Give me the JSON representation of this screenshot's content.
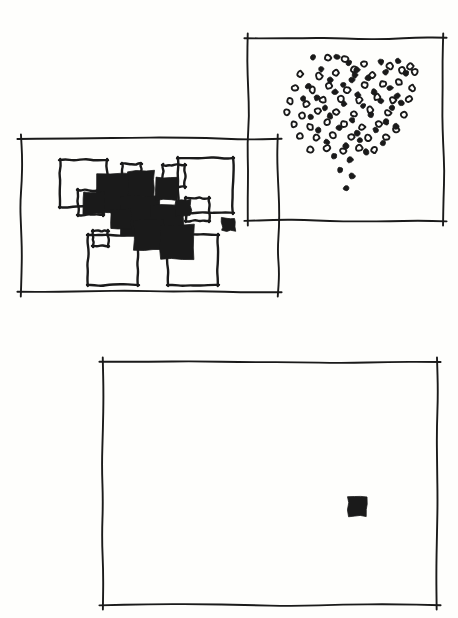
{
  "figure": {
    "title": "",
    "style": "hand-drawn ink sketch",
    "ink_color": "#1a1a1a",
    "paper_color": "#fefefc",
    "width": 458,
    "height": 618
  },
  "chart_data": {
    "type": "scatter",
    "title": "",
    "xlabel": "",
    "ylabel": "",
    "grid": false,
    "legend": "none",
    "panels": [
      {
        "id": "panel-squares",
        "name": "left-panel-overlapping-squares",
        "frame": {
          "x": 21,
          "y": 139,
          "width": 257,
          "height": 153
        },
        "marker_type": "square",
        "note": "cluster of overlapping filled and outlined squares plus one isolated small filled square",
        "filled_squares": [
          {
            "x": 97,
            "y": 174,
            "size": 38
          },
          {
            "x": 128,
            "y": 171,
            "size": 26
          },
          {
            "x": 120,
            "y": 196,
            "size": 40
          },
          {
            "x": 156,
            "y": 178,
            "size": 22
          },
          {
            "x": 150,
            "y": 205,
            "size": 34
          },
          {
            "x": 83,
            "y": 192,
            "size": 22
          },
          {
            "x": 134,
            "y": 220,
            "size": 30
          },
          {
            "x": 160,
            "y": 225,
            "size": 34
          },
          {
            "x": 111,
            "y": 209,
            "size": 20
          },
          {
            "x": 175,
            "y": 200,
            "size": 16
          },
          {
            "x": 222,
            "y": 218,
            "size": 13
          }
        ],
        "outlined_squares": [
          {
            "x": 60,
            "y": 160,
            "size": 47
          },
          {
            "x": 78,
            "y": 190,
            "size": 25
          },
          {
            "x": 122,
            "y": 164,
            "size": 19
          },
          {
            "x": 163,
            "y": 165,
            "size": 22
          },
          {
            "x": 178,
            "y": 158,
            "size": 55
          },
          {
            "x": 186,
            "y": 198,
            "size": 23
          },
          {
            "x": 93,
            "y": 231,
            "size": 15
          },
          {
            "x": 88,
            "y": 235,
            "size": 50
          },
          {
            "x": 168,
            "y": 235,
            "size": 50
          }
        ],
        "isolated_square": {
          "x": 222,
          "y": 218,
          "size": 13
        }
      },
      {
        "id": "panel-dots",
        "name": "top-right-panel-dot-cluster",
        "frame": {
          "x": 248,
          "y": 38,
          "width": 195,
          "height": 183
        },
        "marker_type": "circle",
        "note": "dense cluster of filled and open circles, denser at top, thinning into a tail at lower centre",
        "n_filled": 48,
        "n_open": 54,
        "filled_points": [
          [
            313,
            57
          ],
          [
            337,
            57
          ],
          [
            321,
            69
          ],
          [
            349,
            63
          ],
          [
            357,
            70
          ],
          [
            355,
            75
          ],
          [
            381,
            62
          ],
          [
            398,
            61
          ],
          [
            330,
            80
          ],
          [
            343,
            85
          ],
          [
            352,
            80
          ],
          [
            308,
            86
          ],
          [
            368,
            78
          ],
          [
            386,
            72
          ],
          [
            406,
            73
          ],
          [
            317,
            98
          ],
          [
            335,
            92
          ],
          [
            303,
            99
          ],
          [
            358,
            95
          ],
          [
            374,
            92
          ],
          [
            390,
            88
          ],
          [
            397,
            96
          ],
          [
            325,
            108
          ],
          [
            344,
            104
          ],
          [
            363,
            106
          ],
          [
            381,
            101
          ],
          [
            392,
            108
          ],
          [
            401,
            103
          ],
          [
            311,
            117
          ],
          [
            330,
            116
          ],
          [
            352,
            120
          ],
          [
            371,
            115
          ],
          [
            386,
            122
          ],
          [
            318,
            130
          ],
          [
            339,
            128
          ],
          [
            357,
            133
          ],
          [
            376,
            130
          ],
          [
            396,
            126
          ],
          [
            327,
            142
          ],
          [
            346,
            146
          ],
          [
            360,
            140
          ],
          [
            383,
            143
          ],
          [
            334,
            156
          ],
          [
            350,
            160
          ],
          [
            366,
            152
          ],
          [
            340,
            170
          ],
          [
            352,
            176
          ],
          [
            346,
            188
          ]
        ],
        "open_points": [
          [
            328,
            58
          ],
          [
            345,
            59
          ],
          [
            364,
            64
          ],
          [
            390,
            66
          ],
          [
            410,
            66
          ],
          [
            300,
            74
          ],
          [
            319,
            76
          ],
          [
            336,
            73
          ],
          [
            354,
            69
          ],
          [
            372,
            75
          ],
          [
            402,
            70
          ],
          [
            415,
            72
          ],
          [
            295,
            88
          ],
          [
            312,
            90
          ],
          [
            329,
            86
          ],
          [
            347,
            90
          ],
          [
            365,
            85
          ],
          [
            383,
            84
          ],
          [
            399,
            82
          ],
          [
            412,
            88
          ],
          [
            290,
            101
          ],
          [
            306,
            104
          ],
          [
            323,
            100
          ],
          [
            341,
            99
          ],
          [
            359,
            100
          ],
          [
            377,
            97
          ],
          [
            393,
            100
          ],
          [
            409,
            99
          ],
          [
            287,
            112
          ],
          [
            302,
            116
          ],
          [
            318,
            111
          ],
          [
            336,
            112
          ],
          [
            354,
            114
          ],
          [
            370,
            110
          ],
          [
            388,
            113
          ],
          [
            404,
            115
          ],
          [
            294,
            124
          ],
          [
            310,
            127
          ],
          [
            327,
            122
          ],
          [
            344,
            124
          ],
          [
            362,
            127
          ],
          [
            379,
            124
          ],
          [
            396,
            130
          ],
          [
            300,
            136
          ],
          [
            316,
            138
          ],
          [
            333,
            135
          ],
          [
            351,
            137
          ],
          [
            368,
            138
          ],
          [
            386,
            137
          ],
          [
            310,
            150
          ],
          [
            327,
            148
          ],
          [
            343,
            151
          ],
          [
            359,
            148
          ],
          [
            374,
            150
          ]
        ]
      },
      {
        "id": "panel-single",
        "name": "bottom-panel-single-square",
        "frame": {
          "x": 103,
          "y": 362,
          "width": 334,
          "height": 243
        },
        "marker_type": "square",
        "note": "empty frame containing a single small filled square right of centre",
        "filled_squares": [
          {
            "x": 348,
            "y": 497,
            "size": 19
          }
        ]
      }
    ]
  }
}
